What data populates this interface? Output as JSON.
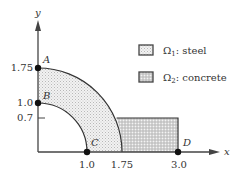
{
  "axes": {
    "x_label": "x",
    "y_label": "y",
    "x_ticks": [
      "1.0",
      "1.75",
      "3.0"
    ],
    "y_ticks": [
      "1.75",
      "1.0",
      "0.7"
    ]
  },
  "points": {
    "A": "A",
    "B": "B",
    "C": "C",
    "D": "D"
  },
  "legend": [
    {
      "symbol": "Ω",
      "subscript": "1",
      "text": ": steel"
    },
    {
      "symbol": "Ω",
      "subscript": "2",
      "text": ": concrete"
    }
  ],
  "colors": {
    "steel_fill": "#ececec",
    "concrete_fill": "#cfcfcf",
    "stroke": "#333333"
  }
}
